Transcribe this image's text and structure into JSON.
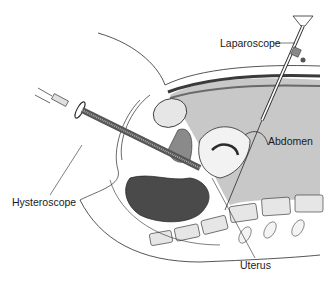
{
  "figure": {
    "labels": {
      "laparoscope": "Laparoscope",
      "abdomen": "Abdomen",
      "hysteroscope": "Hysteroscope",
      "uterus": "Uterus"
    },
    "colors": {
      "background": "#ffffff",
      "line": "#2a2a2a",
      "abdomen_fill": "#c8c8c8",
      "dark_tissue": "#4a4a4a",
      "mid_tissue": "#8a8a8a",
      "light_tissue": "#e6e6e6"
    }
  }
}
